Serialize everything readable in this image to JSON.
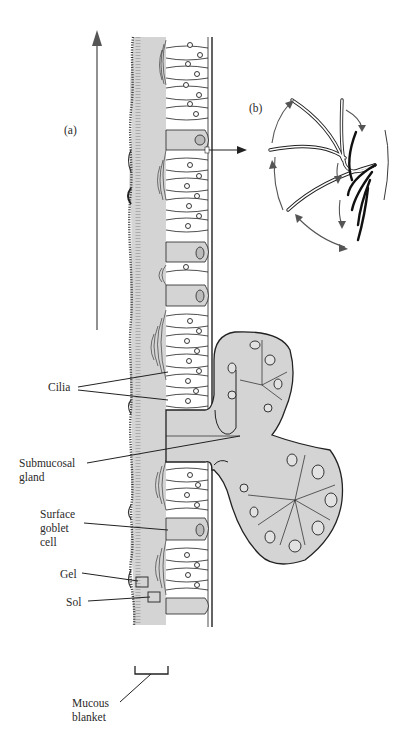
{
  "figure": {
    "panel_labels": {
      "a": "(a)",
      "b": "(b)"
    },
    "labels": {
      "cilia": "Cilia",
      "submucosal_gland_1": "Submucosal",
      "submucosal_gland_2": "gland",
      "surface_goblet_1": "Surface",
      "surface_goblet_2": "goblet",
      "surface_goblet_3": "cell",
      "gel": "Gel",
      "sol": "Sol",
      "mucous_blanket_1": "Mucous",
      "mucous_blanket_2": "blanket"
    },
    "colors": {
      "mucus": "#d3d3d3",
      "ink": "#1e1e1e",
      "arrow": "#555555"
    }
  }
}
